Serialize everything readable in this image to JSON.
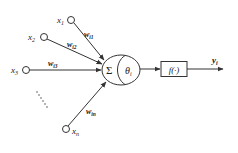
{
  "diagram": {
    "inputs": [
      {
        "id": "x1",
        "label": "x",
        "sub": "1",
        "weight": "w",
        "weight_sub": "i1"
      },
      {
        "id": "x2",
        "label": "x",
        "sub": "2",
        "weight": "w",
        "weight_sub": "i2"
      },
      {
        "id": "x3",
        "label": "x",
        "sub": "3",
        "weight": "w",
        "weight_sub": "i3"
      },
      {
        "id": "xn",
        "label": "x",
        "sub": "n",
        "weight": "w",
        "weight_sub": "in"
      }
    ],
    "ellipsis": "......",
    "summation": {
      "symbol": "Σ"
    },
    "threshold": {
      "symbol": "θ",
      "sub": "i"
    },
    "activation": {
      "label": "f(·)"
    },
    "output": {
      "label": "y",
      "sub": "i"
    }
  }
}
